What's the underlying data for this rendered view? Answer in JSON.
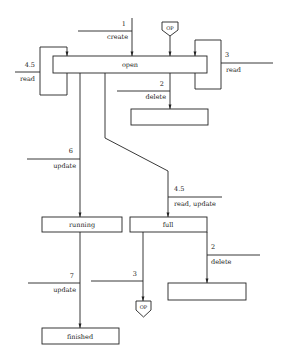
{
  "diagram": {
    "states": {
      "open": "open",
      "running": "running",
      "full": "full",
      "finished": "finished",
      "empty_top": "",
      "empty_bottom": ""
    },
    "connectors": {
      "op_top": "OP",
      "op_bottom": "OP"
    },
    "transitions": {
      "create": {
        "number": "1",
        "operation": "create"
      },
      "read_left": {
        "number": "4.5",
        "operation": "read"
      },
      "read_right": {
        "number": "3",
        "operation": "read"
      },
      "delete_open": {
        "number": "2",
        "operation": "delete"
      },
      "update_running": {
        "number": "6",
        "operation": "update"
      },
      "read_update_full": {
        "number": "4.5",
        "operation": "read, update"
      },
      "delete_full": {
        "number": "2",
        "operation": "delete"
      },
      "update_finished": {
        "number": "7",
        "operation": "update"
      },
      "full_to_op": {
        "number": "3",
        "operation": ""
      }
    }
  }
}
